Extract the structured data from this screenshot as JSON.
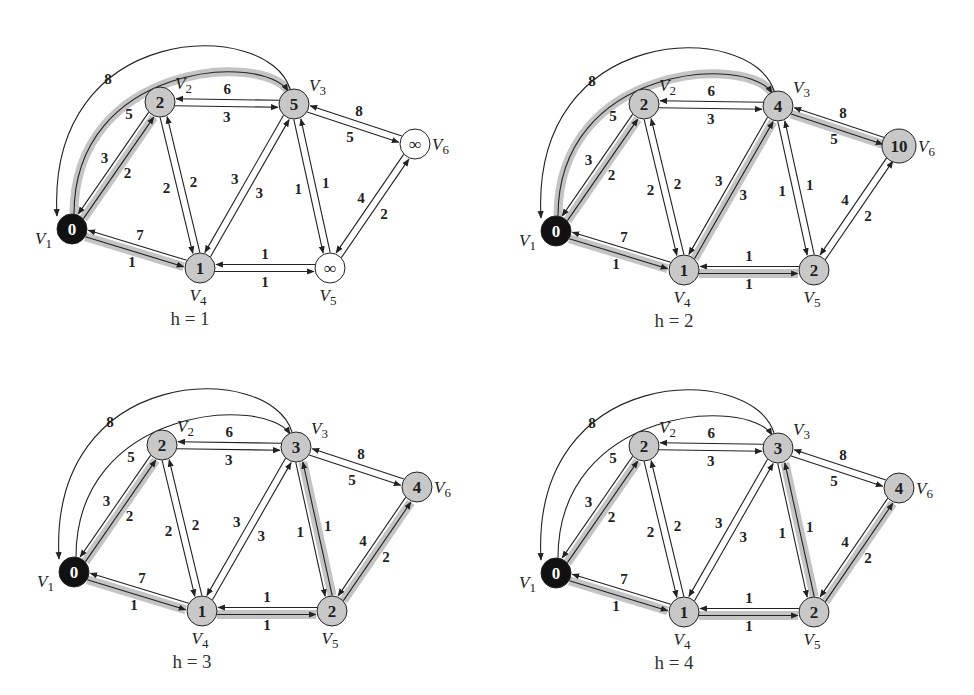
{
  "figure": {
    "colors": {
      "source_fill": "#111111",
      "visited_fill": "#c8c8c8",
      "unvisited_fill": "#ffffff",
      "highlight": "#c4c4c4",
      "edge": "#222222"
    }
  },
  "graph": {
    "vertices": [
      {
        "id": "V1",
        "name": "V",
        "sub": "1",
        "x": 0,
        "y": 127,
        "label_pos": "left"
      },
      {
        "id": "V2",
        "name": "V",
        "sub": "2",
        "x": 88,
        "y": 0,
        "label_pos": "top-right"
      },
      {
        "id": "V3",
        "name": "V",
        "sub": "3",
        "x": 222,
        "y": 2,
        "label_pos": "top-right"
      },
      {
        "id": "V4",
        "name": "V",
        "sub": "4",
        "x": 128,
        "y": 166,
        "label_pos": "bottom"
      },
      {
        "id": "V5",
        "name": "V",
        "sub": "5",
        "x": 258,
        "y": 166,
        "label_pos": "bottom"
      },
      {
        "id": "V6",
        "name": "V",
        "sub": "6",
        "x": 343,
        "y": 42,
        "label_pos": "right"
      }
    ],
    "edges": [
      {
        "id": "e13",
        "from": "V1",
        "to": "V3",
        "weight": "5",
        "curve": "inner"
      },
      {
        "id": "e31",
        "from": "V3",
        "to": "V1",
        "weight": "8",
        "curve": "outer"
      },
      {
        "id": "e12",
        "from": "V1",
        "to": "V2",
        "weight": "2"
      },
      {
        "id": "e21",
        "from": "V2",
        "to": "V1",
        "weight": "3"
      },
      {
        "id": "e14",
        "from": "V1",
        "to": "V4",
        "weight": "1"
      },
      {
        "id": "e41",
        "from": "V4",
        "to": "V1",
        "weight": "7"
      },
      {
        "id": "e23",
        "from": "V2",
        "to": "V3",
        "weight": "3"
      },
      {
        "id": "e32",
        "from": "V3",
        "to": "V2",
        "weight": "6"
      },
      {
        "id": "e24",
        "from": "V2",
        "to": "V4",
        "weight": "2"
      },
      {
        "id": "e42",
        "from": "V4",
        "to": "V2",
        "weight": "2"
      },
      {
        "id": "e43",
        "from": "V4",
        "to": "V3",
        "weight": "3"
      },
      {
        "id": "e34",
        "from": "V3",
        "to": "V4",
        "weight": "3"
      },
      {
        "id": "e35",
        "from": "V3",
        "to": "V5",
        "weight": "1"
      },
      {
        "id": "e53",
        "from": "V5",
        "to": "V3",
        "weight": "1"
      },
      {
        "id": "e36",
        "from": "V3",
        "to": "V6",
        "weight": "5"
      },
      {
        "id": "e63",
        "from": "V6",
        "to": "V3",
        "weight": "8"
      },
      {
        "id": "e45",
        "from": "V4",
        "to": "V5",
        "weight": "1"
      },
      {
        "id": "e54",
        "from": "V5",
        "to": "V4",
        "weight": "1"
      },
      {
        "id": "e56",
        "from": "V5",
        "to": "V6",
        "weight": "2"
      },
      {
        "id": "e65",
        "from": "V6",
        "to": "V5",
        "weight": "4"
      }
    ]
  },
  "panels": [
    {
      "caption": "h = 1",
      "origin": [
        72,
        102
      ],
      "distances": {
        "V1": "0",
        "V2": "2",
        "V3": "5",
        "V4": "1",
        "V5": "∞",
        "V6": "∞"
      },
      "highlighted_edges": [
        "e13",
        "e12",
        "e14"
      ]
    },
    {
      "caption": "h = 2",
      "origin": [
        556,
        104
      ],
      "distances": {
        "V1": "0",
        "V2": "2",
        "V3": "4",
        "V4": "1",
        "V5": "2",
        "V6": "10"
      },
      "highlighted_edges": [
        "e13",
        "e12",
        "e14",
        "e43",
        "e45",
        "e36"
      ]
    },
    {
      "caption": "h = 3",
      "origin": [
        74,
        445
      ],
      "distances": {
        "V1": "0",
        "V2": "2",
        "V3": "3",
        "V4": "1",
        "V5": "2",
        "V6": "4"
      },
      "highlighted_edges": [
        "e12",
        "e14",
        "e45",
        "e53",
        "e56"
      ]
    },
    {
      "caption": "h = 4",
      "origin": [
        556,
        446
      ],
      "distances": {
        "V1": "0",
        "V2": "2",
        "V3": "3",
        "V4": "1",
        "V5": "2",
        "V6": "4"
      },
      "highlighted_edges": [
        "e12",
        "e14",
        "e45",
        "e53",
        "e56"
      ]
    }
  ]
}
